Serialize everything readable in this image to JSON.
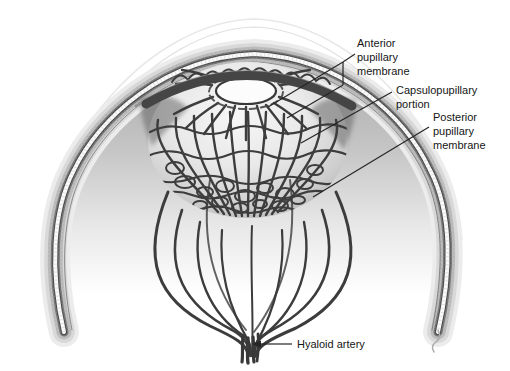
{
  "figure": {
    "kind": "anatomical-diagram"
  },
  "labels": {
    "anterior": [
      "Anterior",
      "pupillary",
      "membrane"
    ],
    "capsulopupillary": [
      "Capsulopupillary",
      "portion"
    ],
    "posterior": [
      "Posterior",
      "pupillary",
      "membrane"
    ],
    "hyaloid": "Hyaloid artery"
  },
  "colors": {
    "background": "#ffffff",
    "vessel": "#3d3d3d",
    "label_text": "#161616",
    "leader_line": "#262626",
    "wall_outer_halo": "#ececec",
    "wall_light_band": "#d8d8d8",
    "wall_mid_band": "#bcbcbc",
    "wall_dark_band": "#757575",
    "wall_white_band": "#fafafa",
    "lens_highlight": "#f7f7f7",
    "lens_shadow": "#b3b3b3"
  }
}
